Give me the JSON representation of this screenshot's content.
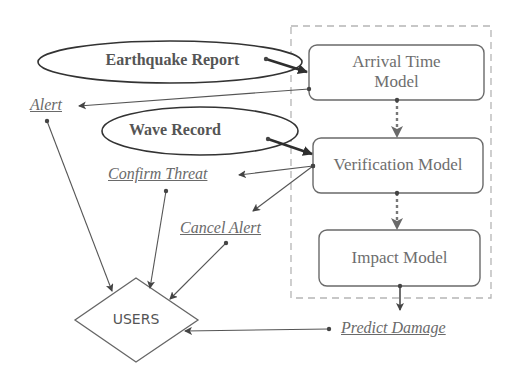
{
  "diagram": {
    "inputs": [
      {
        "id": "earthquake-report",
        "label": "Earthquake Report"
      },
      {
        "id": "wave-record",
        "label": "Wave Record"
      }
    ],
    "models": [
      {
        "id": "arrival-time-model",
        "label_line1": "Arrival Time",
        "label_line2": "Model"
      },
      {
        "id": "verification-model",
        "label": "Verification Model"
      },
      {
        "id": "impact-model",
        "label": "Impact Model"
      }
    ],
    "outputs": [
      {
        "id": "alert",
        "label": "Alert"
      },
      {
        "id": "confirm-threat",
        "label": "Confirm Threat"
      },
      {
        "id": "cancel-alert",
        "label": "Cancel Alert"
      },
      {
        "id": "predict-damage",
        "label": "Predict Damage"
      }
    ],
    "actor": {
      "id": "users",
      "label": "USERS"
    },
    "edges": [
      {
        "from": "earthquake-report",
        "to": "arrival-time-model",
        "style": "bold"
      },
      {
        "from": "wave-record",
        "to": "verification-model",
        "style": "bold"
      },
      {
        "from": "arrival-time-model",
        "to": "verification-model",
        "style": "dotted"
      },
      {
        "from": "verification-model",
        "to": "impact-model",
        "style": "dotted"
      },
      {
        "from": "arrival-time-model",
        "to": "alert",
        "style": "thin"
      },
      {
        "from": "verification-model",
        "to": "confirm-threat",
        "style": "thin"
      },
      {
        "from": "verification-model",
        "to": "cancel-alert",
        "style": "thin"
      },
      {
        "from": "impact-model",
        "to": "predict-damage",
        "style": "thin"
      },
      {
        "from": "alert",
        "to": "users",
        "style": "thin"
      },
      {
        "from": "confirm-threat",
        "to": "users",
        "style": "thin"
      },
      {
        "from": "cancel-alert",
        "to": "users",
        "style": "thin"
      },
      {
        "from": "predict-damage",
        "to": "users",
        "style": "thin"
      }
    ],
    "colors": {
      "stroke_dark": "#3a3a3a",
      "stroke_box": "#6a6a6a",
      "dashed_container": "#b0b0b0",
      "text": "#6e6e6e"
    }
  }
}
